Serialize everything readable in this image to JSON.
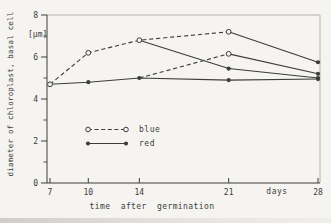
{
  "figure": {
    "y_axis_label": "diameter of chloroplast, basal cell",
    "y_unit": "[µm]",
    "x_axis_title": "time after germination",
    "days_label": "days",
    "ink_color": "#3c3c3c",
    "frame_light_color": "#b6b3ad",
    "paper_color": "#f5f4f1"
  },
  "chart_data": {
    "type": "line",
    "title": "",
    "xlabel": "time after germination",
    "ylabel": "diameter of chloroplast, basal cell [µm]",
    "x_unit": "days",
    "xlim": [
      7,
      28
    ],
    "ylim": [
      0,
      8
    ],
    "xticks": [
      7,
      10,
      14,
      21,
      28
    ],
    "yticks_major": [
      0,
      2,
      4,
      6,
      8
    ],
    "yticks_minor": [
      1,
      3,
      5,
      7
    ],
    "grid": false,
    "legend_position": "inside-lower-left",
    "legend": [
      {
        "label": "blue",
        "line": "dashed",
        "marker": "open-circle"
      },
      {
        "label": "red",
        "line": "solid",
        "marker": "filled-circle"
      }
    ],
    "series": [
      {
        "name": "blue-continuous",
        "line": "dashed",
        "x": [
          7,
          10,
          14,
          21
        ],
        "y": [
          4.7,
          6.2,
          6.8,
          7.2
        ],
        "markers": [
          "open",
          "open",
          "open",
          "open"
        ]
      },
      {
        "name": "blue-then-red-from-day-21",
        "line": "solid",
        "x": [
          21,
          28
        ],
        "y": [
          7.2,
          5.75
        ],
        "markers": [
          "none",
          "filled"
        ]
      },
      {
        "name": "blue-then-red-from-day-14",
        "line": "solid",
        "x": [
          14,
          21,
          28
        ],
        "y": [
          6.8,
          5.45,
          5.0
        ],
        "markers": [
          "none",
          "filled",
          "filled"
        ]
      },
      {
        "name": "red-continuous",
        "line": "solid",
        "x": [
          7,
          10,
          14,
          21,
          28
        ],
        "y": [
          4.7,
          4.8,
          5.0,
          4.9,
          4.95
        ],
        "markers": [
          "none",
          "filled",
          "filled",
          "filled",
          "filled"
        ]
      },
      {
        "name": "red-then-blue-from-day-14",
        "line": "dashed",
        "x": [
          14,
          21
        ],
        "y": [
          5.0,
          6.15
        ],
        "markers": [
          "none",
          "open"
        ]
      },
      {
        "name": "red-blue-then-red-from-day-21",
        "line": "solid",
        "x": [
          21,
          28
        ],
        "y": [
          6.15,
          5.2
        ],
        "markers": [
          "none",
          "filled"
        ]
      }
    ]
  }
}
